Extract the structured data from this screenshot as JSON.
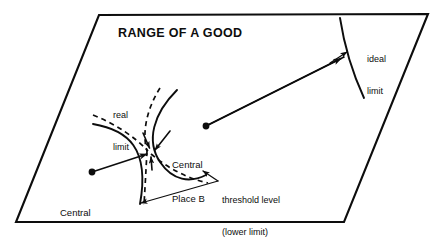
{
  "figure": {
    "kind": "concept-diagram",
    "title": "RANGE OF A GOOD",
    "background_color": "#ffffff",
    "ink_color": "#0d0d0d"
  },
  "labels": {
    "title": "RANGE OF A GOOD",
    "ideal_limit_line1": "ideal",
    "ideal_limit_line2": "limit",
    "real_limit_line1": "real",
    "real_limit_line2": "limit",
    "central_place_b_line1": "Central",
    "central_place_b_line2": "Place B",
    "central_place_a_line1": "Central",
    "central_place_a_line2": "Place A",
    "threshold_line1": "threshold level",
    "threshold_line2": "(lower limit)"
  },
  "elements": {
    "frame_name": "parallelogram-plane",
    "central_place_a_dot": "central-place-a-dot",
    "central_place_b_dot": "central-place-b-dot",
    "range_arrow": "range-arrow-to-ideal-limit",
    "ideal_limit_arc": "ideal-limit-arc",
    "real_limit_arcs": "real-limit-dashed-arcs",
    "threshold_arc_a": "threshold-arc-central-place-a",
    "threshold_arc_b": "threshold-arc-central-place-b",
    "convergence_arrows": "convergence-arrows",
    "threshold_leaders": "threshold-leader-lines"
  }
}
